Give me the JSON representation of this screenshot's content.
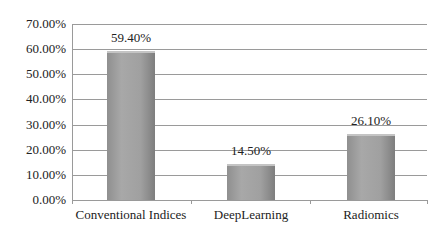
{
  "chart_data": {
    "type": "bar",
    "title": "",
    "xlabel": "",
    "ylabel": "",
    "categories": [
      "Conventional Indices",
      "DeepLearning",
      "Radiomics"
    ],
    "values": [
      59.4,
      14.5,
      26.1
    ],
    "data_labels": [
      "59.40%",
      "14.50%",
      "26.10%"
    ],
    "ylim": [
      0,
      70
    ],
    "yticks": [
      "0.00%",
      "10.00%",
      "20.00%",
      "30.00%",
      "40.00%",
      "50.00%",
      "60.00%",
      "70.00%"
    ],
    "grid": true,
    "legend": "none",
    "bar_color": "#9a9a9a"
  }
}
